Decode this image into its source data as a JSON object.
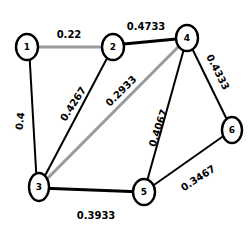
{
  "diagram": {
    "type": "weighted-undirected-graph",
    "nodes": [
      {
        "id": "1",
        "label": "1",
        "x": 27,
        "y": 47
      },
      {
        "id": "2",
        "label": "2",
        "x": 113,
        "y": 47
      },
      {
        "id": "3",
        "label": "3",
        "x": 39,
        "y": 187
      },
      {
        "id": "4",
        "label": "4",
        "x": 187,
        "y": 38
      },
      {
        "id": "5",
        "label": "5",
        "x": 144,
        "y": 192
      },
      {
        "id": "6",
        "label": "6",
        "x": 232,
        "y": 130
      }
    ],
    "edges": [
      {
        "from": "1",
        "to": "2",
        "weight": "0.22",
        "style": "gray"
      },
      {
        "from": "1",
        "to": "3",
        "weight": "0.4",
        "style": "black"
      },
      {
        "from": "2",
        "to": "3",
        "weight": "0.4267",
        "style": "black"
      },
      {
        "from": "2",
        "to": "4",
        "weight": "0.4733",
        "style": "thick"
      },
      {
        "from": "3",
        "to": "4",
        "weight": "0.2933",
        "style": "gray"
      },
      {
        "from": "4",
        "to": "5",
        "weight": "0.4067",
        "style": "black"
      },
      {
        "from": "4",
        "to": "6",
        "weight": "0.4333",
        "style": "black"
      },
      {
        "from": "3",
        "to": "5",
        "weight": "0.3933",
        "style": "thick"
      },
      {
        "from": "5",
        "to": "6",
        "weight": "0.3467",
        "style": "black"
      }
    ]
  }
}
